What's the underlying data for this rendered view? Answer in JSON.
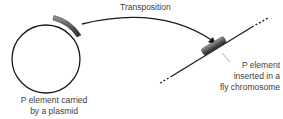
{
  "diagram": {
    "arrow_label": "Transposition",
    "plasmid_label_line1": "P element carried",
    "plasmid_label_line2": "by a plasmid",
    "inserted_label_line1": "P element",
    "inserted_label_line2": "inserted in a",
    "inserted_label_line3": "fly chromosome",
    "colors": {
      "line": "#1a1a1a",
      "p_element_dark": "#3a3a3a",
      "p_element_light": "#8a8a8a",
      "text": "#404040"
    }
  }
}
